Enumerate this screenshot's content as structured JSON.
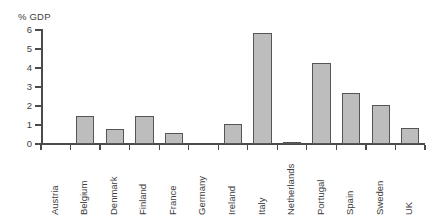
{
  "figure": {
    "top_caption_fragment": "",
    "background_color": "#ffffff",
    "bar_fill_color": "#bdbdbd",
    "bar_edge_color": "#555555",
    "axis_color": "#4b4b4b",
    "text_color": "#3d3d3d"
  },
  "chart_data": {
    "type": "bar",
    "title": "",
    "subtitle": "",
    "xlabel": "",
    "ylabel": "% GDP",
    "ylim": [
      0,
      6
    ],
    "ytick_labels": [
      "0",
      "1",
      "2",
      "3",
      "4",
      "5",
      "6"
    ],
    "ytick_values": [
      0,
      1,
      2,
      3,
      4,
      5,
      6
    ],
    "grid": false,
    "legend": null,
    "legend_position": "none",
    "orientation": "vertical",
    "categories": [
      "Austria",
      "Belgium",
      "Denmark",
      "Finland",
      "France",
      "Germany",
      "Ireland",
      "Italy",
      "Netherlands",
      "Portugal",
      "Spain",
      "Sweden",
      "UK"
    ],
    "values": [
      0,
      1.5,
      0.8,
      1.5,
      0.6,
      0,
      1.05,
      5.85,
      0.1,
      4.25,
      2.7,
      2.05,
      0.85
    ],
    "annotations": []
  }
}
